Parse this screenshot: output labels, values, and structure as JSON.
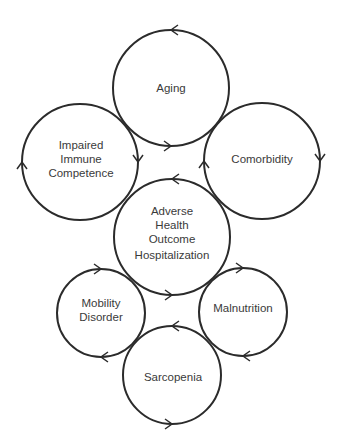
{
  "diagram": {
    "type": "cycle-of-circles",
    "stroke_color": "#2b2b2b",
    "text_color": "#3a3a3a",
    "background": "#ffffff",
    "nodes": [
      {
        "id": "aging",
        "lines": [
          "Aging"
        ],
        "cx": 171,
        "cy": 88,
        "r": 58,
        "arrows": [
          {
            "angle": -90,
            "dir": "ccw"
          },
          {
            "angle": 90,
            "dir": "ccw"
          }
        ]
      },
      {
        "id": "impaired-immune-competence",
        "lines": [
          "Impaired",
          "Immune",
          "Competence"
        ],
        "cx": 80,
        "cy": 162,
        "r": 58,
        "arrows": [
          {
            "angle": 180,
            "dir": "cw"
          },
          {
            "angle": 0,
            "dir": "cw"
          }
        ]
      },
      {
        "id": "comorbidity",
        "lines": [
          "Comorbidity"
        ],
        "cx": 262,
        "cy": 161,
        "r": 58,
        "arrows": [
          {
            "angle": 0,
            "dir": "cw"
          },
          {
            "angle": 180,
            "dir": "cw"
          }
        ]
      },
      {
        "id": "adverse-health-outcome",
        "lines": [
          "Adverse",
          "Health",
          "Outcome",
          "Hospitalization"
        ],
        "cx": 172,
        "cy": 237,
        "r": 58,
        "arrows": [
          {
            "angle": -90,
            "dir": "ccw"
          },
          {
            "angle": 90,
            "dir": "ccw"
          }
        ]
      },
      {
        "id": "mobility-disorder",
        "lines": [
          "Mobility",
          "Disorder"
        ],
        "cx": 101,
        "cy": 313,
        "r": 44,
        "arrows": [
          {
            "angle": -90,
            "dir": "cw"
          },
          {
            "angle": 90,
            "dir": "cw"
          }
        ]
      },
      {
        "id": "malnutrition",
        "lines": [
          "Malnutrition"
        ],
        "cx": 243,
        "cy": 312,
        "r": 44,
        "arrows": [
          {
            "angle": -90,
            "dir": "cw"
          },
          {
            "angle": 90,
            "dir": "cw"
          }
        ]
      },
      {
        "id": "sarcopenia",
        "lines": [
          "Sarcopenia"
        ],
        "cx": 172,
        "cy": 375,
        "r": 49,
        "arrows": [
          {
            "angle": -90,
            "dir": "ccw"
          },
          {
            "angle": 90,
            "dir": "ccw"
          }
        ]
      }
    ]
  }
}
